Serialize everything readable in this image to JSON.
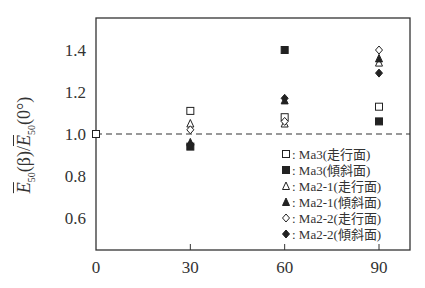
{
  "chart_data": {
    "type": "scatter",
    "title": "",
    "xlabel": "",
    "ylabel": "Ē50(β)/Ē50(0°)",
    "ylabel_parts": {
      "num": "E",
      "num_sub": "50",
      "mid": "(β)/",
      "den": "E",
      "den_sub": "50",
      "tail": "(0°)"
    },
    "xlim": [
      0,
      100
    ],
    "ylim": [
      0.45,
      1.55
    ],
    "x_ticks": [
      0,
      30,
      60,
      90
    ],
    "y_ticks": [
      0.6,
      0.8,
      1.0,
      1.2,
      1.4
    ],
    "x_tick_labels": [
      "0",
      "30",
      "60",
      "90"
    ],
    "y_tick_labels": [
      "0.6",
      "0.8",
      "1.0",
      "1.2",
      "1.4"
    ],
    "reference_line": {
      "y": 1.0,
      "style": "dashed"
    },
    "grid": false,
    "legend_position": "lower right",
    "series": [
      {
        "name": "Ma3(走行面)",
        "marker": "square-open",
        "x": [
          0,
          30,
          60,
          90
        ],
        "y": [
          1.0,
          1.11,
          1.08,
          1.13
        ]
      },
      {
        "name": "Ma3(傾斜面)",
        "marker": "square-filled",
        "x": [
          30,
          60,
          90
        ],
        "y": [
          0.94,
          1.4,
          1.06
        ]
      },
      {
        "name": "Ma2-1(走行面)",
        "marker": "triangle-open",
        "x": [
          30,
          60,
          90
        ],
        "y": [
          1.05,
          1.05,
          1.34
        ]
      },
      {
        "name": "Ma2-1(傾斜面)",
        "marker": "triangle-filled",
        "x": [
          30,
          60,
          90
        ],
        "y": [
          0.96,
          1.16,
          1.36
        ]
      },
      {
        "name": "Ma2-2(走行面)",
        "marker": "diamond-open",
        "x": [
          30,
          60,
          90
        ],
        "y": [
          1.02,
          1.06,
          1.4
        ]
      },
      {
        "name": "Ma2-2(傾斜面)",
        "marker": "diamond-filled",
        "x": [
          30,
          60,
          90
        ],
        "y": [
          0.95,
          1.17,
          1.29
        ]
      }
    ]
  },
  "legend": [
    {
      "label": ": Ma3(走行面)"
    },
    {
      "label": ": Ma3(傾斜面)"
    },
    {
      "label": ": Ma2-1(走行面)"
    },
    {
      "label": ": Ma2-1(傾斜面)"
    },
    {
      "label": ": Ma2-2(走行面)"
    },
    {
      "label": ": Ma2-2(傾斜面)"
    }
  ]
}
